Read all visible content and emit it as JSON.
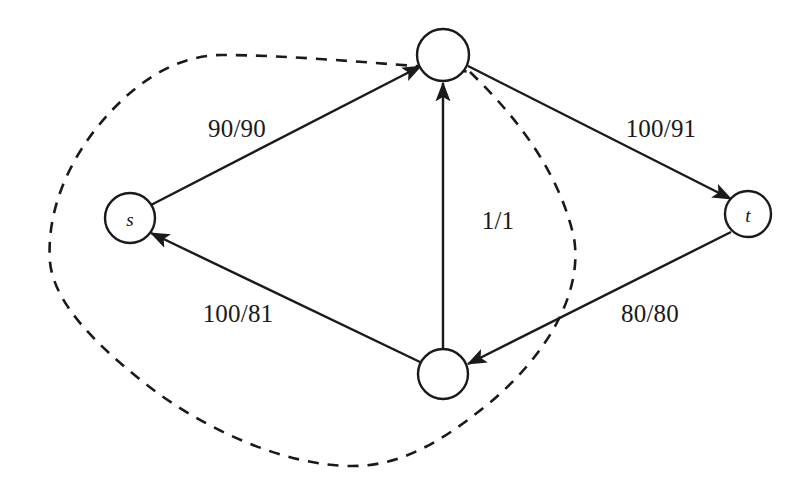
{
  "diagram": {
    "width": 808,
    "height": 490,
    "background_color": "#ffffff",
    "stroke_color": "#1a1a1a",
    "nodes": [
      {
        "id": "s",
        "label": "s",
        "cx": 130,
        "cy": 218,
        "r": 25,
        "in_cut_set": true
      },
      {
        "id": "v_top",
        "label": "",
        "cx": 443,
        "cy": 55,
        "r": 26,
        "in_cut_set": false
      },
      {
        "id": "v_bot",
        "label": "",
        "cx": 443,
        "cy": 374,
        "r": 25,
        "in_cut_set": true
      },
      {
        "id": "t",
        "label": "t",
        "cx": 748,
        "cy": 214,
        "r": 23,
        "in_cut_set": false
      }
    ],
    "edges": [
      {
        "id": "s-to-top",
        "from": "s",
        "to": "v_top",
        "label": "90/90",
        "capacity": 90,
        "flow": 90,
        "label_x": 237,
        "label_y": 128
      },
      {
        "id": "top-to-t",
        "from": "v_top",
        "to": "t",
        "label": "100/91",
        "capacity": 100,
        "flow": 91,
        "label_x": 661,
        "label_y": 128
      },
      {
        "id": "t-to-bot",
        "from": "t",
        "to": "v_bot",
        "label": "80/80",
        "capacity": 80,
        "flow": 80,
        "label_x": 650,
        "label_y": 313
      },
      {
        "id": "bot-to-s",
        "from": "v_bot",
        "to": "s",
        "label": "100/81",
        "capacity": 100,
        "flow": 81,
        "label_x": 238,
        "label_y": 313
      },
      {
        "id": "bot-to-top",
        "from": "v_bot",
        "to": "v_top",
        "label": "1/1",
        "capacity": 1,
        "flow": 1,
        "label_x": 498,
        "label_y": 220
      }
    ],
    "cut": {
      "name": "cut-boundary",
      "style": "dashed",
      "encloses": [
        "s",
        "v_bot"
      ],
      "excludes": [
        "v_top",
        "t"
      ]
    }
  }
}
